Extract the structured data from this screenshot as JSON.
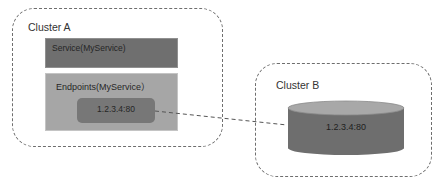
{
  "diagram": {
    "cluster_a": {
      "label": "Cluster A",
      "service": {
        "label": "Service(MyService)"
      },
      "endpoints": {
        "label": "Endpoints(MyService）",
        "address": "1.2.3.4:80"
      }
    },
    "cluster_b": {
      "label": "Cluster B",
      "database": {
        "label": "1.2.3.4:80"
      }
    },
    "connector": {
      "from": "endpoints-address",
      "to": "cluster-b-database",
      "style": "dashed"
    },
    "colors": {
      "service_fill": "#6f6f6f",
      "endpoints_fill": "#a6a6a6",
      "address_fill": "#777777",
      "cylinder_body": "#6e6e6e",
      "cylinder_top": "#a8a8a8",
      "dashed_border": "#6e6e6e"
    }
  }
}
